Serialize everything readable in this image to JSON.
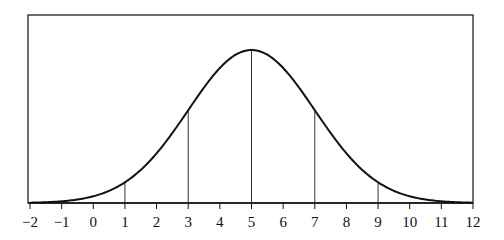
{
  "chart_data": {
    "type": "line",
    "title": "",
    "xlabel": "",
    "ylabel": "",
    "mean": 5,
    "std_dev": 2,
    "xlim": [
      -2,
      12
    ],
    "x_ticks": [
      -2,
      -1,
      0,
      1,
      2,
      3,
      4,
      5,
      6,
      7,
      8,
      9,
      10,
      11,
      12
    ],
    "x_tick_labels": [
      "−2",
      "−1",
      "0",
      "1",
      "2",
      "3",
      "4",
      "5",
      "6",
      "7",
      "8",
      "9",
      "10",
      "11",
      "12"
    ],
    "vertical_lines_at": [
      1,
      3,
      5,
      7,
      9
    ],
    "grid": false,
    "legend": null,
    "series": [
      {
        "name": "normal curve",
        "x": [
          -2,
          -1,
          0,
          1,
          2,
          3,
          4,
          5,
          6,
          7,
          8,
          9,
          10,
          11,
          12
        ],
        "y_relative": [
          0.0022,
          0.0111,
          0.0439,
          0.1353,
          0.3247,
          0.6065,
          0.8825,
          1.0,
          0.8825,
          0.6065,
          0.3247,
          0.1353,
          0.0439,
          0.0111,
          0.0022
        ]
      }
    ],
    "colors": {
      "curve": "#111111",
      "axis": "#111111",
      "frame": "#222222",
      "vlines": "#333333"
    }
  }
}
